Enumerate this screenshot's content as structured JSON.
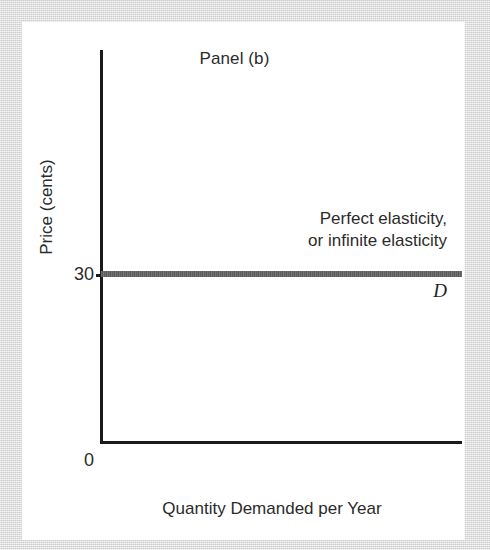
{
  "figure": {
    "panel_title": "Panel (b)",
    "y_axis_title": "Price (cents)",
    "x_axis_title": "Quantity Demanded per Year",
    "origin_label": "0",
    "y_tick_label": "30",
    "curve_label": "D",
    "annotation_line_1": "Perfect elasticity,",
    "annotation_line_2": "or infinite elasticity",
    "colors": {
      "background_mat": "#d6d6d6",
      "panel": "#ffffff",
      "axis": "#1a1a1a",
      "text": "#2b2b2b",
      "curve": "#646464"
    }
  },
  "chart_data": {
    "type": "line",
    "title": "Panel (b)",
    "subtitle": "",
    "xlabel": "Quantity Demanded per Year",
    "ylabel": "Price (cents)",
    "xlim": [
      0,
      100
    ],
    "ylim": [
      0,
      60
    ],
    "grid": false,
    "legend_position": "none",
    "x_tick_labels": [],
    "y_tick_labels": [
      "0",
      "30"
    ],
    "series": [
      {
        "name": "D",
        "description": "Perfectly elastic (horizontal) demand curve at price = 30 cents",
        "x": [
          0,
          100
        ],
        "values": [
          30,
          30
        ]
      }
    ],
    "annotations": [
      {
        "text": "Perfect elasticity, or infinite elasticity",
        "x": 92,
        "y": 38,
        "align": "right"
      },
      {
        "text": "D",
        "x": 97,
        "y": 26,
        "align": "right",
        "style": "italic"
      }
    ]
  }
}
